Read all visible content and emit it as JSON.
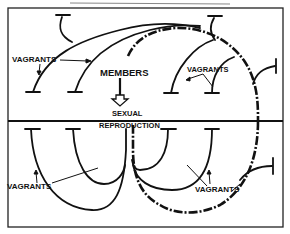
{
  "diagram": {
    "title": "",
    "labels": {
      "members": "MEMBERS",
      "sexual": "SEXUAL",
      "reproduction": "REPRODUCTION",
      "vagrants_top_left": "VAGRANTS",
      "vagrants_top_right": "VAGRANTS",
      "vagrants_bottom_left": "VAGRANTS",
      "vagrants_bottom_right": "VAGRANTS"
    },
    "colors": {
      "ink": "#111111",
      "background": "#ffffff",
      "frame": "#222222"
    },
    "legend": {
      "solid_line": "lineage branch",
      "dash_dot_line": "member lineage"
    }
  }
}
